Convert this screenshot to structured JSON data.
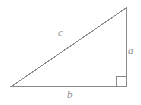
{
  "figure": {
    "kind": "right-triangle-diagram",
    "background_color": "#ffffff",
    "stroke_color": "#8a8a8a",
    "label_color": "#8a8a8a",
    "stroke_width": 1,
    "width": 141,
    "height": 105
  },
  "geometry": {
    "vertices": {
      "bottom_left": {
        "x": 12,
        "y": 86
      },
      "bottom_right": {
        "x": 126,
        "y": 86
      },
      "top_right": {
        "x": 126,
        "y": 8
      }
    },
    "sides": [
      {
        "name": "base",
        "label": "b",
        "from": "bottom_left",
        "to": "bottom_right"
      },
      {
        "name": "vertical-leg",
        "label": "a",
        "from": "bottom_right",
        "to": "top_right"
      },
      {
        "name": "hypotenuse",
        "label": "c",
        "from": "top_right",
        "to": "bottom_left"
      }
    ],
    "right_angle_marker": {
      "at": "bottom_right",
      "size": 10,
      "points": "116,86 116,76 126,76"
    },
    "polygon_points": "12,86 126,86 126,8"
  },
  "labels": {
    "hypotenuse": "c",
    "vertical_leg": "a",
    "base": "b"
  }
}
